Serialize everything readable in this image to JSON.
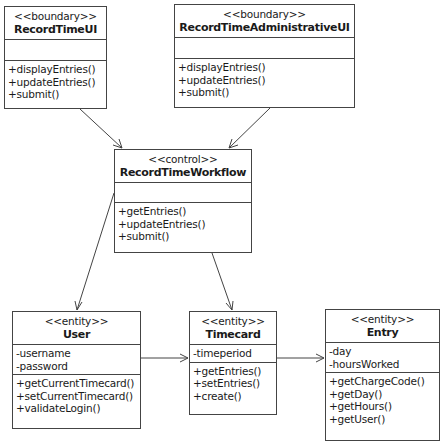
{
  "diagram": {
    "type": "UML class diagram",
    "classes": {
      "record_time_ui": {
        "stereotype": "<<boundary>>",
        "name": "RecordTimeUI",
        "attributes": [],
        "operations": [
          "+displayEntries()",
          "+updateEntries()",
          "+submit()"
        ]
      },
      "record_time_admin_ui": {
        "stereotype": "<<boundary>>",
        "name": "RecordTimeAdministrativeUI",
        "attributes": [],
        "operations": [
          "+displayEntries()",
          "+updateEntries()",
          "+submit()"
        ]
      },
      "record_time_workflow": {
        "stereotype": "<<control>>",
        "name": "RecordTimeWorkflow",
        "attributes": [],
        "operations": [
          "+getEntries()",
          "+updateEntries()",
          "+submit()"
        ]
      },
      "user": {
        "stereotype": "<<entity>>",
        "name": "User",
        "attributes": [
          "-username",
          "-password"
        ],
        "operations": [
          "+getCurrentTimecard()",
          "+setCurrentTimecard()",
          "+validateLogin()"
        ]
      },
      "timecard": {
        "stereotype": "<<entity>>",
        "name": "Timecard",
        "attributes": [
          "-timeperiod"
        ],
        "operations": [
          "+getEntries()",
          "+setEntries()",
          "+create()"
        ]
      },
      "entry": {
        "stereotype": "<<entity>>",
        "name": "Entry",
        "attributes": [
          "-day",
          "-hoursWorked"
        ],
        "operations": [
          "+getChargeCode()",
          "+getDay()",
          "+getHours()",
          "+getUser()"
        ]
      }
    },
    "associations": [
      {
        "from": "RecordTimeUI",
        "to": "RecordTimeWorkflow",
        "navigable": true
      },
      {
        "from": "RecordTimeAdministrativeUI",
        "to": "RecordTimeWorkflow",
        "navigable": true
      },
      {
        "from": "RecordTimeWorkflow",
        "to": "User",
        "navigable": true
      },
      {
        "from": "RecordTimeWorkflow",
        "to": "Timecard",
        "navigable": true
      },
      {
        "from": "User",
        "to": "Timecard",
        "navigable": true
      },
      {
        "from": "Timecard",
        "to": "Entry",
        "navigable": true
      }
    ],
    "colors": {
      "line": "#444444",
      "background": "#ffffff",
      "text": "#1a1a1a"
    }
  }
}
